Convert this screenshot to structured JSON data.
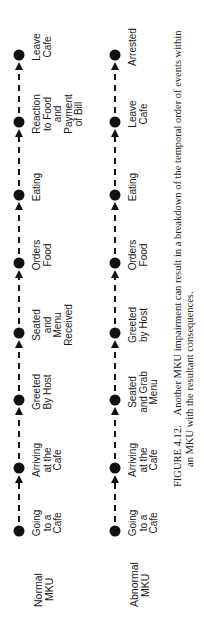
{
  "rows": [
    {
      "label": [
        "Normal",
        "MKU"
      ],
      "events": [
        [
          "Going",
          "to a",
          "Cafe"
        ],
        [
          "Arriving",
          "at the",
          "Cafe"
        ],
        [
          "Greeted",
          "By Host"
        ],
        [
          "Seated",
          "and",
          "Menu",
          "Received"
        ],
        [
          "Orders",
          "Food"
        ],
        [
          "Eating"
        ],
        [
          "Reaction",
          "to Food",
          "and",
          "Payment",
          "of Bill"
        ],
        [
          "Leave",
          "Cafe"
        ]
      ]
    },
    {
      "label": [
        "Abnormal",
        "MKU"
      ],
      "events": [
        [
          "Going",
          "to a",
          "Cafe"
        ],
        [
          "Arriving",
          "at the",
          "Cafe"
        ],
        [
          "Seated",
          "and Grab",
          "Menu"
        ],
        [
          "Greeted",
          "by Host"
        ],
        [
          "Orders",
          "Food"
        ],
        [
          "Eating"
        ],
        [
          "Leave",
          "Cafe"
        ],
        [
          "Arrested"
        ]
      ]
    }
  ],
  "caption": {
    "figure_number": "FIGURE 4.12.",
    "line1": "Another MKU impairment can result in a breakdown of the temporal order of events within",
    "line2": "an MKU with the resultant consequences."
  },
  "colors": {
    "ink": "#111111"
  }
}
